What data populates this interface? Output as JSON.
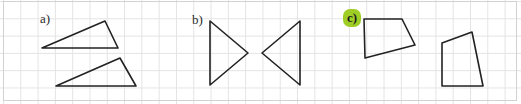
{
  "worksheet": {
    "type": "geometry-worksheet-grid",
    "width": 521,
    "height": 104,
    "background_color": "#ffffff",
    "grid_color": "#e3e3e3",
    "grid_spacing_px": 17.3,
    "frame_color": "#d2d2d2",
    "stroke_color": "#222222",
    "stroke_width": 1.6
  },
  "labels": [
    {
      "id": "label-a",
      "text": "a)",
      "x": 40,
      "y": 12,
      "highlighted": false,
      "highlight_color": ""
    },
    {
      "id": "label-b",
      "text": "b)",
      "x": 192,
      "y": 13,
      "highlighted": false,
      "highlight_color": ""
    },
    {
      "id": "label-c",
      "text": "c)",
      "x": 343,
      "y": 9,
      "highlighted": true,
      "highlight_color": "#9ece26"
    }
  ],
  "shapes": [
    {
      "id": "shape-a-triangle-1",
      "group": "a",
      "kind": "triangle",
      "points": "42,48 105,21 118,48",
      "vertices": [
        [
          42,
          48
        ],
        [
          105,
          21
        ],
        [
          118,
          48
        ]
      ]
    },
    {
      "id": "shape-a-triangle-2",
      "group": "a",
      "kind": "triangle",
      "points": "56,86 120,58 136,86",
      "vertices": [
        [
          56,
          86
        ],
        [
          120,
          58
        ],
        [
          136,
          86
        ]
      ]
    },
    {
      "id": "shape-b-triangle-left",
      "group": "b",
      "kind": "triangle",
      "points": "210,21 248,53 210,85",
      "vertices": [
        [
          210,
          21
        ],
        [
          248,
          53
        ],
        [
          210,
          85
        ]
      ]
    },
    {
      "id": "shape-b-triangle-right",
      "group": "b",
      "kind": "triangle",
      "points": "300,21 300,85 262,53",
      "vertices": [
        [
          300,
          21
        ],
        [
          300,
          85
        ],
        [
          262,
          53
        ]
      ]
    },
    {
      "id": "shape-c-quad-left",
      "group": "c",
      "kind": "quadrilateral",
      "points": "364,19 402,19 415,45 365,58",
      "vertices": [
        [
          364,
          19
        ],
        [
          402,
          19
        ],
        [
          415,
          45
        ],
        [
          365,
          58
        ]
      ]
    },
    {
      "id": "shape-c-quad-right",
      "group": "c",
      "kind": "quadrilateral",
      "points": "472,32 483,86 442,86 442,43",
      "vertices": [
        [
          472,
          32
        ],
        [
          483,
          86
        ],
        [
          442,
          86
        ],
        [
          442,
          43
        ]
      ]
    }
  ]
}
